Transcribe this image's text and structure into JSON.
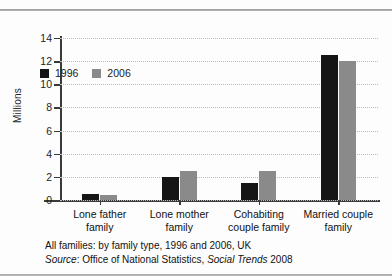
{
  "chart_data": {
    "type": "bar",
    "title": "",
    "xlabel": "",
    "ylabel": "Millions",
    "ylim": [
      0,
      14
    ],
    "yticks": [
      0,
      2,
      4,
      6,
      8,
      10,
      12,
      14
    ],
    "grid": true,
    "legend_position": "top-left-inside",
    "categories": [
      "Lone father family",
      "Lone mother family",
      "Cohabiting couple family",
      "Married couple family"
    ],
    "category_lines": [
      [
        "Lone father",
        "family"
      ],
      [
        "Lone mother",
        "family"
      ],
      [
        "Cohabiting",
        "couple family"
      ],
      [
        "Married couple",
        "family"
      ]
    ],
    "series": [
      {
        "name": "1996",
        "color": "#151515",
        "values": [
          0.5,
          2.0,
          1.5,
          12.5
        ]
      },
      {
        "name": "2006",
        "color": "#8a8a8a",
        "values": [
          0.4,
          2.5,
          2.5,
          12.0
        ]
      }
    ]
  },
  "caption": {
    "line1": "All families: by family type, 1996 and 2006, UK",
    "source_label": "Source",
    "source_sep": ": ",
    "source_body": "Office of National Statistics, ",
    "source_publication": "Social Trends",
    "source_year": " 2008"
  },
  "colors": {
    "series_1996": "#151515",
    "series_2006": "#8a8a8a",
    "axis": "#3a3a3a",
    "grid": "#bdbdbd",
    "background": "#fdfdfd"
  }
}
